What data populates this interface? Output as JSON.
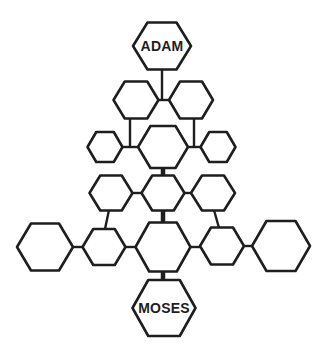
{
  "diagram": {
    "type": "genealogy-hexagon-tree",
    "top_node": {
      "label": "ADAM"
    },
    "bottom_node": {
      "label": "MOSES"
    },
    "stroke_color": "#1e1e1e",
    "background_color": "#ffffff",
    "nodes": [
      {
        "id": "adam",
        "label": "ADAM",
        "cx": 162,
        "cy": 46,
        "w": 58,
        "h": 47
      },
      {
        "id": "r2-left",
        "label": "",
        "cx": 136,
        "cy": 100,
        "w": 45,
        "h": 37
      },
      {
        "id": "r2-right",
        "label": "",
        "cx": 191,
        "cy": 100,
        "w": 44,
        "h": 37
      },
      {
        "id": "r3-left",
        "label": "",
        "cx": 105,
        "cy": 147,
        "w": 35,
        "h": 30
      },
      {
        "id": "r3-center",
        "label": "",
        "cx": 163,
        "cy": 147,
        "w": 50,
        "h": 42
      },
      {
        "id": "r3-right",
        "label": "",
        "cx": 218,
        "cy": 147,
        "w": 35,
        "h": 30
      },
      {
        "id": "r4-left",
        "label": "",
        "cx": 111,
        "cy": 193,
        "w": 43,
        "h": 35
      },
      {
        "id": "r4-center",
        "label": "",
        "cx": 163,
        "cy": 193,
        "w": 43,
        "h": 35
      },
      {
        "id": "r4-right",
        "label": "",
        "cx": 213,
        "cy": 193,
        "w": 44,
        "h": 35
      },
      {
        "id": "r5-far-left",
        "label": "",
        "cx": 45,
        "cy": 247,
        "w": 56,
        "h": 47
      },
      {
        "id": "r5-left",
        "label": "",
        "cx": 104,
        "cy": 247,
        "w": 43,
        "h": 36
      },
      {
        "id": "r5-center",
        "label": "",
        "cx": 163,
        "cy": 247,
        "w": 55,
        "h": 49
      },
      {
        "id": "r5-right",
        "label": "",
        "cx": 222,
        "cy": 246,
        "w": 44,
        "h": 37
      },
      {
        "id": "r5-far-right",
        "label": "",
        "cx": 281,
        "cy": 246,
        "w": 58,
        "h": 50
      },
      {
        "id": "moses",
        "label": "MOSES",
        "cx": 164,
        "cy": 308,
        "w": 63,
        "h": 56
      }
    ]
  }
}
